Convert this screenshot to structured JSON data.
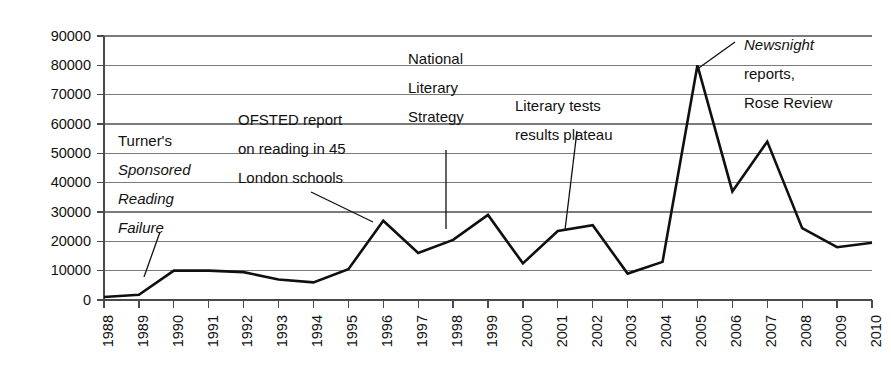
{
  "chart_data": {
    "type": "line",
    "title": "",
    "subtitle": "",
    "xlabel": "",
    "ylabel": "",
    "grid": true,
    "legend": "none",
    "xlim": [
      "1988",
      "2010"
    ],
    "ylim": [
      0,
      90000
    ],
    "ytick_step": 10000,
    "categories": [
      "1988",
      "1989",
      "1990",
      "1991",
      "1992",
      "1993",
      "1994",
      "1995",
      "1996",
      "1997",
      "1998",
      "1999",
      "2000",
      "2001",
      "2002",
      "2003",
      "2004",
      "2005",
      "2006",
      "2007",
      "2008",
      "2009",
      "2010"
    ],
    "values": [
      1000,
      1800,
      10000,
      10000,
      9500,
      7000,
      6000,
      10500,
      27000,
      16000,
      20500,
      29000,
      12500,
      23500,
      25500,
      9000,
      13000,
      80000,
      37000,
      54000,
      24500,
      18000,
      19500
    ],
    "ytick_labels": [
      "90000",
      "80000",
      "70000",
      "60000",
      "50000",
      "40000",
      "30000",
      "20000",
      "10000",
      "0"
    ],
    "series": [
      {
        "name": "",
        "values": [
          1000,
          1800,
          10000,
          10000,
          9500,
          7000,
          6000,
          10500,
          27000,
          16000,
          20500,
          29000,
          12500,
          23500,
          25500,
          9000,
          13000,
          80000,
          37000,
          54000,
          24500,
          18000,
          19500
        ]
      }
    ],
    "line_color": "#101010",
    "grid_color": "#7b7b7b",
    "background_color": "#ffffff",
    "annotations": [
      {
        "id": "turner",
        "lines": [
          {
            "text": "Turner's",
            "italic": false
          },
          {
            "text": "Sponsored",
            "italic": true
          },
          {
            "text": "Reading",
            "italic": true
          },
          {
            "text": "Failure",
            "italic": true
          }
        ],
        "points_to_year": "1990"
      },
      {
        "id": "ofsted",
        "lines": [
          {
            "text": "OFSTED report",
            "italic": false
          },
          {
            "text": "on reading in 45",
            "italic": false
          },
          {
            "text": "London schools",
            "italic": false
          }
        ],
        "points_to_year": "1996"
      },
      {
        "id": "national-literary-strategy",
        "lines": [
          {
            "text": "National",
            "italic": false
          },
          {
            "text": "Literary",
            "italic": false
          },
          {
            "text": "Strategy",
            "italic": false
          }
        ],
        "points_to_year": "1998"
      },
      {
        "id": "literary-tests-plateau",
        "lines": [
          {
            "text": "Literary tests",
            "italic": false
          },
          {
            "text": "results plateau",
            "italic": false
          }
        ],
        "points_to_year": "2003"
      },
      {
        "id": "newsnight-rose-review",
        "lines": [
          {
            "text": "Newsnight",
            "italic": true
          },
          {
            "text": "reports,",
            "italic": false
          },
          {
            "text": "Rose Review",
            "italic": false
          }
        ],
        "points_to_year": "2005"
      }
    ]
  }
}
